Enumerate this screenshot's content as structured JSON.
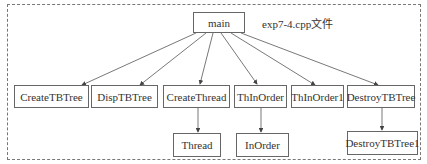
{
  "diagram": {
    "file_label": "exp7-4.cpp文件",
    "root": {
      "id": "main",
      "label": "main"
    },
    "level1": [
      {
        "id": "CreateTBTree",
        "label": "CreateTBTree"
      },
      {
        "id": "DispTBTree",
        "label": "DispTBTree"
      },
      {
        "id": "CreateThread",
        "label": "CreateThread"
      },
      {
        "id": "ThInOrder",
        "label": "ThInOrder"
      },
      {
        "id": "ThInOrder1",
        "label": "ThInOrder1"
      },
      {
        "id": "DestroyTBTree",
        "label": "DestroyTBTree"
      }
    ],
    "level2": [
      {
        "id": "Thread",
        "label": "Thread",
        "parent": "CreateThread"
      },
      {
        "id": "InOrder",
        "label": "InOrder",
        "parent": "ThInOrder"
      },
      {
        "id": "DestroyTBTree1",
        "label": "DestroyTBTree1",
        "parent": "DestroyTBTree"
      }
    ],
    "edges": [
      [
        "main",
        "CreateTBTree"
      ],
      [
        "main",
        "DispTBTree"
      ],
      [
        "main",
        "CreateThread"
      ],
      [
        "main",
        "ThInOrder"
      ],
      [
        "main",
        "ThInOrder1"
      ],
      [
        "main",
        "DestroyTBTree"
      ],
      [
        "CreateThread",
        "Thread"
      ],
      [
        "ThInOrder",
        "InOrder"
      ],
      [
        "DestroyTBTree",
        "DestroyTBTree1"
      ]
    ]
  }
}
